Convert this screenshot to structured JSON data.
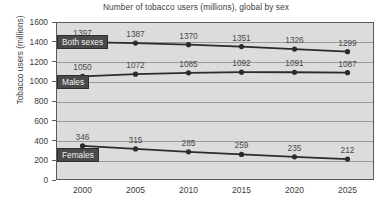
{
  "chart_data": {
    "type": "line",
    "title": "Number of tobacco users (millions), global by sex",
    "xlabel": "",
    "ylabel": "Tobacco users (millions)",
    "categories": [
      "2000",
      "2005",
      "2010",
      "2015",
      "2020",
      "2025"
    ],
    "x": [
      2000,
      2005,
      2010,
      2015,
      2020,
      2025
    ],
    "ylim": [
      0,
      1600
    ],
    "yticks": [
      "0",
      "200",
      "400",
      "600",
      "800",
      "1000",
      "1200",
      "1400",
      "1600"
    ],
    "grid": true,
    "legend_position": "inline-labels",
    "series": [
      {
        "name": "Both sexes",
        "values": [
          1397,
          1387,
          1370,
          1351,
          1326,
          1299
        ],
        "color": "#2b2b2b"
      },
      {
        "name": "Males",
        "values": [
          1050,
          1072,
          1085,
          1092,
          1091,
          1087
        ],
        "color": "#2b2b2b"
      },
      {
        "name": "Females",
        "values": [
          346,
          315,
          285,
          259,
          235,
          212
        ],
        "color": "#2b2b2b"
      }
    ]
  },
  "colors": {
    "plot_background": "#dcdcdc",
    "page_background": "#ffffff",
    "gridline": "#9a9a9a",
    "line": "#2b2b2b",
    "marker": "#2b2b2b",
    "tag_background": "#4a4a4a",
    "tag_text": "#f0f0f0",
    "axis_text": "#3c3c3c",
    "label_text": "#4a4a4a"
  }
}
